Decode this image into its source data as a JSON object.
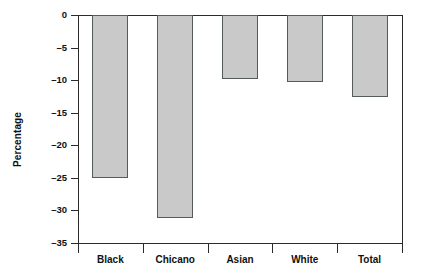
{
  "chart_data": {
    "type": "bar",
    "title": "",
    "xlabel": "",
    "ylabel": "Percentage",
    "categories": [
      "Black",
      "Chicano",
      "Asian",
      "White",
      "Total"
    ],
    "values": [
      -25.0,
      -31.2,
      -9.9,
      -10.3,
      -12.6
    ],
    "ylim": [
      -35,
      0
    ],
    "yticks": [
      0,
      -5,
      -10,
      -15,
      -20,
      -25,
      -30,
      -35
    ],
    "ytick_labels": [
      "0",
      "–5",
      "–10",
      "–15",
      "–20",
      "–25",
      "–30",
      "–35"
    ],
    "grid": false,
    "legend": null,
    "orientation": "vertical",
    "bar_fill_color": "#c9c9c9",
    "bar_border_color": "#555a5c",
    "axis_color": "#2b2b2b",
    "background_color": "#ffffff"
  }
}
